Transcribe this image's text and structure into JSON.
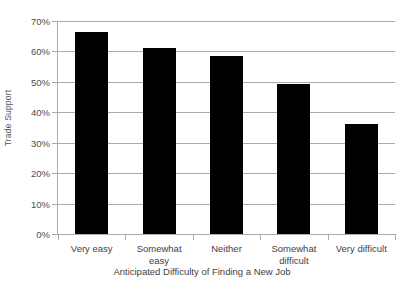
{
  "chart_data": {
    "type": "bar",
    "title": "",
    "xlabel": "Anticipated Difficulty of Finding a New Job",
    "ylabel": "Trade Support",
    "categories": [
      "Very easy",
      "Somewhat easy",
      "Neither",
      "Somewhat difficult",
      "Very difficult"
    ],
    "values": [
      66.4,
      61.0,
      58.5,
      49.3,
      36.2
    ],
    "value_labels": [
      "66%",
      "61%",
      "59%",
      "49%",
      "36%"
    ],
    "ylim": [
      0,
      70
    ],
    "ytick_values": [
      0,
      10,
      20,
      30,
      40,
      50,
      60,
      70
    ],
    "ytick_labels": [
      "0%",
      "10%",
      "20%",
      "30%",
      "40%",
      "50%",
      "60%",
      "70%"
    ],
    "grid": true,
    "legend": false,
    "legend_position": "none",
    "series": [
      {
        "name": "Trade Support",
        "color": "#000000",
        "values": [
          66.4,
          61.0,
          58.5,
          49.3,
          36.2
        ]
      }
    ],
    "colors": {
      "bar": "#000000",
      "gridline": "#a9acae",
      "axis": "#a9acae",
      "text": "#3f4044",
      "background": "#ffffff"
    }
  }
}
